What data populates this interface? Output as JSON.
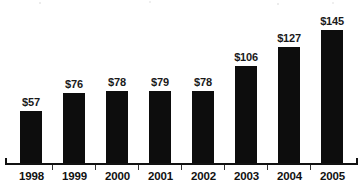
{
  "chart_data": {
    "type": "bar",
    "title": "",
    "subtitle": "",
    "xlabel": "",
    "ylabel": "",
    "categories": [
      "1998",
      "1999",
      "2000",
      "2001",
      "2002",
      "2003",
      "2004",
      "2005"
    ],
    "values": [
      57,
      76,
      78,
      79,
      78,
      106,
      127,
      145
    ],
    "data_labels": [
      "$57",
      "$76",
      "$78",
      "$79",
      "$78",
      "$106",
      "$127",
      "$145"
    ],
    "value_prefix": "$",
    "ylim": [
      0,
      160
    ],
    "grid": false,
    "legend": null,
    "legend_position": "none",
    "axis": {
      "x_axis_visible": true,
      "y_axis_visible": false,
      "tick_marks": true
    },
    "colors": {
      "bar": "#0d0d0d",
      "background": "#ffffff",
      "axis": "#111111",
      "label_text": "#1a1a1a"
    }
  }
}
